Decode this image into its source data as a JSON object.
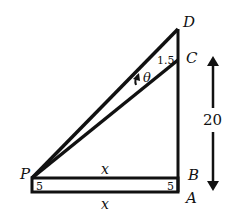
{
  "diagram": {
    "points": {
      "P": {
        "label": "P"
      },
      "A": {
        "label": "A"
      },
      "B": {
        "label": "B"
      },
      "C": {
        "label": "C"
      },
      "D": {
        "label": "D"
      }
    },
    "labels": {
      "x_top": "x",
      "x_bottom": "x",
      "angle": "θ",
      "cd_length": "1.5",
      "height": "20",
      "p_width": "5",
      "b_width": "5"
    },
    "colors": {
      "stroke": "#111111",
      "background": "#ffffff"
    }
  }
}
